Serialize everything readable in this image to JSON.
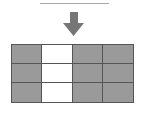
{
  "diagram": {
    "top_line": {
      "color": "#a8a8a8"
    },
    "arrow": {
      "direction": "down",
      "icon": "arrow-down-icon",
      "color": "#767676"
    },
    "grid": {
      "rows": 3,
      "cols": 4,
      "filled_color": "#9a9a9a",
      "empty_color": "#ffffff",
      "border_color": "#555555",
      "cells": [
        [
          true,
          false,
          true,
          true
        ],
        [
          true,
          false,
          true,
          true
        ],
        [
          true,
          false,
          true,
          true
        ]
      ]
    }
  }
}
